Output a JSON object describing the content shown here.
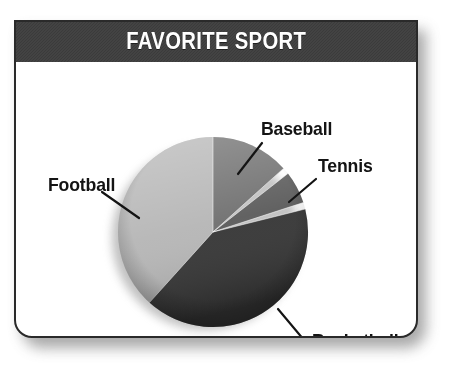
{
  "card": {
    "title": "FAVORITE SPORT"
  },
  "colors": {
    "title_bar": "#3b3b3b",
    "title_text": "#ffffff",
    "card_border": "#2a2a2a",
    "card_background": "#ffffff",
    "label_text": "#141414",
    "football": "#b5b5b5",
    "baseball": "#6e6e6e",
    "tennis": "#5a5a5a",
    "basketball": "#333333"
  },
  "labels": {
    "football": "Football",
    "baseball": "Baseball",
    "tennis": "Tennis",
    "basketball": "Basketball"
  },
  "chart_data": {
    "type": "pie",
    "title": "FAVORITE SPORT",
    "xlabel": "",
    "ylabel": "",
    "legend_position": "none",
    "grid": false,
    "labels_placement": "outside-with-leader-lines",
    "categories": [
      "Football",
      "Baseball",
      "Tennis",
      "Basketball"
    ],
    "values": [
      48,
      13,
      5,
      34
    ],
    "units": "percent",
    "start_angle_deg": 0,
    "direction": "clockwise",
    "slices": [
      {
        "name": "Football",
        "label": "Football",
        "value": 48,
        "color": "#b5b5b5",
        "start_angle_deg": 222,
        "end_angle_deg": 360
      },
      {
        "name": "Baseball",
        "label": "Baseball",
        "value": 13,
        "color": "#6e6e6e",
        "start_angle_deg": 0,
        "end_angle_deg": 48
      },
      {
        "name": "Tennis",
        "label": "Tennis",
        "value": 5,
        "color": "#5a5a5a",
        "start_angle_deg": 52,
        "end_angle_deg": 72
      },
      {
        "name": "Basketball",
        "label": "Basketball",
        "value": 34,
        "color": "#333333",
        "start_angle_deg": 76,
        "end_angle_deg": 222
      }
    ]
  }
}
